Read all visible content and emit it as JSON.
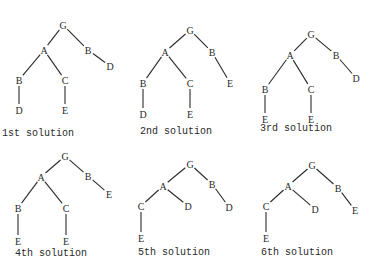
{
  "figure": {
    "trees": [
      {
        "caption": "1st solution",
        "caption_pos": [
          2,
          136
        ],
        "nodes": [
          {
            "id": "G",
            "label": "G",
            "x": 63,
            "y": 25
          },
          {
            "id": "A",
            "label": "A",
            "x": 44,
            "y": 50
          },
          {
            "id": "B1",
            "label": "B",
            "x": 88,
            "y": 50
          },
          {
            "id": "D1",
            "label": "D",
            "x": 110,
            "y": 66
          },
          {
            "id": "B2",
            "label": "B",
            "x": 19,
            "y": 80
          },
          {
            "id": "C",
            "label": "C",
            "x": 65,
            "y": 80
          },
          {
            "id": "D2",
            "label": "D",
            "x": 19,
            "y": 110
          },
          {
            "id": "E",
            "label": "E",
            "x": 65,
            "y": 110
          }
        ],
        "edges": [
          [
            "G",
            "A"
          ],
          [
            "G",
            "B1"
          ],
          [
            "B1",
            "D1"
          ],
          [
            "A",
            "B2"
          ],
          [
            "A",
            "C"
          ],
          [
            "B2",
            "D2"
          ],
          [
            "C",
            "E"
          ]
        ]
      },
      {
        "caption": "2nd solution",
        "caption_pos": [
          140,
          134
        ],
        "nodes": [
          {
            "id": "G",
            "label": "G",
            "x": 190,
            "y": 30
          },
          {
            "id": "A",
            "label": "A",
            "x": 165,
            "y": 52
          },
          {
            "id": "B1",
            "label": "B",
            "x": 212,
            "y": 52
          },
          {
            "id": "E1",
            "label": "E",
            "x": 230,
            "y": 83
          },
          {
            "id": "B2",
            "label": "B",
            "x": 143,
            "y": 83
          },
          {
            "id": "C",
            "label": "C",
            "x": 190,
            "y": 83
          },
          {
            "id": "D",
            "label": "D",
            "x": 143,
            "y": 114
          },
          {
            "id": "E2",
            "label": "E",
            "x": 190,
            "y": 114
          }
        ],
        "edges": [
          [
            "G",
            "A"
          ],
          [
            "G",
            "B1"
          ],
          [
            "B1",
            "E1"
          ],
          [
            "A",
            "B2"
          ],
          [
            "A",
            "C"
          ],
          [
            "B2",
            "D"
          ],
          [
            "C",
            "E2"
          ]
        ]
      },
      {
        "caption": "3rd solution",
        "caption_pos": [
          260,
          131
        ],
        "nodes": [
          {
            "id": "G",
            "label": "G",
            "x": 311,
            "y": 34
          },
          {
            "id": "A",
            "label": "A",
            "x": 290,
            "y": 55
          },
          {
            "id": "B1",
            "label": "B",
            "x": 336,
            "y": 55
          },
          {
            "id": "D",
            "label": "D",
            "x": 356,
            "y": 78
          },
          {
            "id": "B2",
            "label": "B",
            "x": 265,
            "y": 89
          },
          {
            "id": "C",
            "label": "C",
            "x": 311,
            "y": 89
          },
          {
            "id": "E1",
            "label": "E",
            "x": 265,
            "y": 119
          },
          {
            "id": "E2",
            "label": "E",
            "x": 311,
            "y": 119
          }
        ],
        "edges": [
          [
            "G",
            "A"
          ],
          [
            "G",
            "B1"
          ],
          [
            "B1",
            "D"
          ],
          [
            "A",
            "B2"
          ],
          [
            "A",
            "C"
          ],
          [
            "B2",
            "E1"
          ],
          [
            "C",
            "E2"
          ]
        ]
      },
      {
        "caption": "4th solution",
        "caption_pos": [
          15,
          256
        ],
        "nodes": [
          {
            "id": "G",
            "label": "G",
            "x": 65,
            "y": 156
          },
          {
            "id": "A",
            "label": "A",
            "x": 41,
            "y": 177
          },
          {
            "id": "B1",
            "label": "B",
            "x": 88,
            "y": 176
          },
          {
            "id": "E1",
            "label": "E",
            "x": 109,
            "y": 194
          },
          {
            "id": "B2",
            "label": "B",
            "x": 18,
            "y": 208
          },
          {
            "id": "C",
            "label": "C",
            "x": 66,
            "y": 208
          },
          {
            "id": "E2",
            "label": "E",
            "x": 18,
            "y": 241
          },
          {
            "id": "E3",
            "label": "E",
            "x": 66,
            "y": 241
          }
        ],
        "edges": [
          [
            "G",
            "A"
          ],
          [
            "G",
            "B1"
          ],
          [
            "B1",
            "E1"
          ],
          [
            "A",
            "B2"
          ],
          [
            "A",
            "C"
          ],
          [
            "B2",
            "E2"
          ],
          [
            "C",
            "E3"
          ]
        ]
      },
      {
        "caption": "5th solution",
        "caption_pos": [
          138,
          255
        ],
        "nodes": [
          {
            "id": "G",
            "label": "G",
            "x": 190,
            "y": 164
          },
          {
            "id": "A",
            "label": "A",
            "x": 163,
            "y": 186
          },
          {
            "id": "B",
            "label": "B",
            "x": 212,
            "y": 184
          },
          {
            "id": "C",
            "label": "C",
            "x": 141,
            "y": 206
          },
          {
            "id": "D1",
            "label": "D",
            "x": 188,
            "y": 206
          },
          {
            "id": "D2",
            "label": "D",
            "x": 229,
            "y": 207
          },
          {
            "id": "E",
            "label": "E",
            "x": 141,
            "y": 238
          }
        ],
        "edges": [
          [
            "G",
            "A"
          ],
          [
            "G",
            "B"
          ],
          [
            "A",
            "C"
          ],
          [
            "A",
            "D1"
          ],
          [
            "B",
            "D2"
          ],
          [
            "C",
            "E"
          ]
        ]
      },
      {
        "caption": "6th solution",
        "caption_pos": [
          261,
          255
        ],
        "nodes": [
          {
            "id": "G",
            "label": "G",
            "x": 312,
            "y": 165
          },
          {
            "id": "A",
            "label": "A",
            "x": 288,
            "y": 186
          },
          {
            "id": "B",
            "label": "B",
            "x": 338,
            "y": 188
          },
          {
            "id": "C",
            "label": "C",
            "x": 266,
            "y": 206
          },
          {
            "id": "D",
            "label": "D",
            "x": 315,
            "y": 209
          },
          {
            "id": "E1",
            "label": "E",
            "x": 355,
            "y": 210
          },
          {
            "id": "E2",
            "label": "E",
            "x": 266,
            "y": 238
          }
        ],
        "edges": [
          [
            "G",
            "A"
          ],
          [
            "G",
            "B"
          ],
          [
            "A",
            "C"
          ],
          [
            "A",
            "D"
          ],
          [
            "B",
            "E1"
          ],
          [
            "C",
            "E2"
          ]
        ]
      }
    ]
  },
  "style": {
    "ink_color": "#2a2a2a",
    "background": "#ffffff"
  }
}
